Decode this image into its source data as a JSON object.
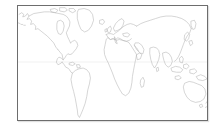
{
  "panel": {
    "title": "World Map Thumbnail",
    "border_color": "#6d6d6d",
    "background_color": "#ffffff"
  },
  "map": {
    "projection": "mercator",
    "coastline_color": "#b3b3b3",
    "graticule_color": "#e2e2e2",
    "lon_range": [
      -170,
      190
    ],
    "lat_range": [
      -58,
      78
    ],
    "graticule_lines": [
      {
        "name": "equator",
        "latitude": 0,
        "y_fraction": 0.4914
      }
    ],
    "landmasses": [
      {
        "name": "north-america"
      },
      {
        "name": "greenland"
      },
      {
        "name": "arctic-islands"
      },
      {
        "name": "south-america"
      },
      {
        "name": "europe"
      },
      {
        "name": "africa"
      },
      {
        "name": "asia"
      },
      {
        "name": "southeast-asia-islands"
      },
      {
        "name": "australia"
      },
      {
        "name": "japan"
      },
      {
        "name": "new-zealand"
      },
      {
        "name": "madagascar"
      },
      {
        "name": "british-isles"
      },
      {
        "name": "iceland"
      }
    ]
  }
}
